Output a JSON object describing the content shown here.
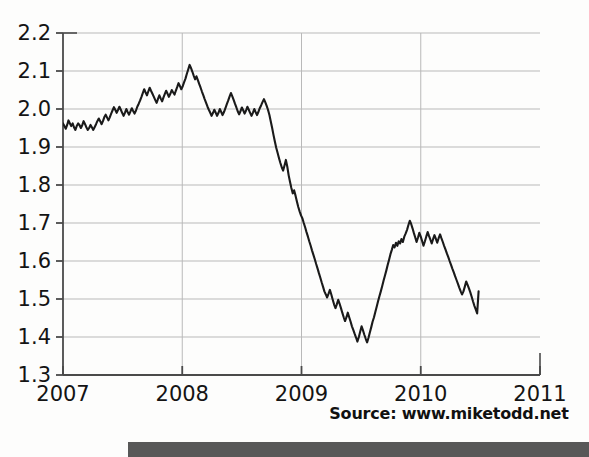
{
  "figure": {
    "source_note": "Source: www.miketodd.net"
  },
  "chart_data": {
    "type": "line",
    "title": "",
    "subtitle": "",
    "xlabel": "",
    "ylabel": "",
    "xlim": [
      2007.0,
      2011.0
    ],
    "ylim": [
      1.3,
      2.2
    ],
    "grid": true,
    "legend": null,
    "x_ticks": [
      "2007",
      "2008",
      "2009",
      "2010",
      "2011"
    ],
    "x_tick_values": [
      2007,
      2008,
      2009,
      2010,
      2011
    ],
    "y_ticks": [
      "1.3",
      "1.4",
      "1.5",
      "1.6",
      "1.7",
      "1.8",
      "1.9",
      "2.0",
      "2.1",
      "2.2"
    ],
    "y_tick_values": [
      1.3,
      1.4,
      1.5,
      1.6,
      1.7,
      1.8,
      1.9,
      2.0,
      2.1,
      2.2
    ],
    "line_color": "#1a1a1a",
    "grid_color": "#b9b9b9",
    "axis_color": "#4a4a4a",
    "series": [
      {
        "name": "Exchange rate",
        "x": [
          2007.0,
          2007.012,
          2007.023,
          2007.035,
          2007.046,
          2007.058,
          2007.069,
          2007.081,
          2007.092,
          2007.104,
          2007.115,
          2007.127,
          2007.138,
          2007.15,
          2007.162,
          2007.173,
          2007.185,
          2007.196,
          2007.208,
          2007.219,
          2007.231,
          2007.242,
          2007.254,
          2007.265,
          2007.277,
          2007.288,
          2007.3,
          2007.312,
          2007.323,
          2007.335,
          2007.346,
          2007.358,
          2007.369,
          2007.381,
          2007.392,
          2007.404,
          2007.415,
          2007.427,
          2007.438,
          2007.45,
          2007.462,
          2007.473,
          2007.485,
          2007.496,
          2007.508,
          2007.519,
          2007.531,
          2007.542,
          2007.554,
          2007.565,
          2007.577,
          2007.588,
          2007.6,
          2007.612,
          2007.623,
          2007.635,
          2007.646,
          2007.658,
          2007.669,
          2007.681,
          2007.692,
          2007.704,
          2007.715,
          2007.727,
          2007.738,
          2007.75,
          2007.762,
          2007.773,
          2007.785,
          2007.796,
          2007.808,
          2007.819,
          2007.831,
          2007.842,
          2007.854,
          2007.865,
          2007.877,
          2007.888,
          2007.9,
          2007.912,
          2007.923,
          2007.935,
          2007.946,
          2007.958,
          2007.969,
          2007.981,
          2007.992,
          2008.004,
          2008.015,
          2008.027,
          2008.038,
          2008.05,
          2008.062,
          2008.073,
          2008.085,
          2008.096,
          2008.108,
          2008.119,
          2008.131,
          2008.142,
          2008.154,
          2008.165,
          2008.177,
          2008.188,
          2008.2,
          2008.212,
          2008.223,
          2008.235,
          2008.246,
          2008.258,
          2008.269,
          2008.281,
          2008.292,
          2008.304,
          2008.315,
          2008.327,
          2008.338,
          2008.35,
          2008.362,
          2008.373,
          2008.385,
          2008.396,
          2008.408,
          2008.419,
          2008.431,
          2008.442,
          2008.454,
          2008.465,
          2008.477,
          2008.488,
          2008.5,
          2008.512,
          2008.523,
          2008.535,
          2008.546,
          2008.558,
          2008.569,
          2008.581,
          2008.592,
          2008.604,
          2008.615,
          2008.627,
          2008.638,
          2008.65,
          2008.662,
          2008.673,
          2008.685,
          2008.696,
          2008.708,
          2008.719,
          2008.731,
          2008.742,
          2008.754,
          2008.765,
          2008.777,
          2008.788,
          2008.8,
          2008.812,
          2008.823,
          2008.835,
          2008.846,
          2008.858,
          2008.869,
          2008.881,
          2008.892,
          2008.904,
          2008.915,
          2008.927,
          2008.938,
          2008.95,
          2008.962,
          2008.973,
          2008.985,
          2008.996,
          2009.008,
          2009.019,
          2009.031,
          2009.042,
          2009.054,
          2009.065,
          2009.077,
          2009.088,
          2009.1,
          2009.112,
          2009.123,
          2009.135,
          2009.146,
          2009.158,
          2009.169,
          2009.181,
          2009.192,
          2009.204,
          2009.215,
          2009.227,
          2009.238,
          2009.25,
          2009.262,
          2009.273,
          2009.285,
          2009.296,
          2009.308,
          2009.319,
          2009.331,
          2009.342,
          2009.354,
          2009.365,
          2009.377,
          2009.388,
          2009.4,
          2009.412,
          2009.423,
          2009.435,
          2009.446,
          2009.458,
          2009.469,
          2009.481,
          2009.492,
          2009.504,
          2009.515,
          2009.527,
          2009.538,
          2009.55,
          2009.562,
          2009.573,
          2009.585,
          2009.596,
          2009.608,
          2009.619,
          2009.631,
          2009.642,
          2009.654,
          2009.665,
          2009.677,
          2009.688,
          2009.7,
          2009.712,
          2009.723,
          2009.735,
          2009.746,
          2009.758,
          2009.769,
          2009.781,
          2009.792,
          2009.804,
          2009.815,
          2009.827,
          2009.838,
          2009.85,
          2009.862,
          2009.873,
          2009.885,
          2009.896,
          2009.908,
          2009.919,
          2009.931,
          2009.942,
          2009.954,
          2009.965,
          2009.977,
          2009.988,
          2010.0,
          2010.012,
          2010.023,
          2010.035,
          2010.046,
          2010.058,
          2010.069,
          2010.081,
          2010.092,
          2010.104,
          2010.115,
          2010.127,
          2010.138,
          2010.15,
          2010.162,
          2010.173,
          2010.185,
          2010.196,
          2010.208,
          2010.219,
          2010.231,
          2010.242,
          2010.254,
          2010.265,
          2010.277,
          2010.288,
          2010.3,
          2010.312,
          2010.323,
          2010.335,
          2010.346,
          2010.358,
          2010.369,
          2010.381,
          2010.392,
          2010.404,
          2010.415,
          2010.427,
          2010.438,
          2010.45,
          2010.462,
          2010.473,
          2010.485
        ],
        "y": [
          1.962,
          1.955,
          1.948,
          1.958,
          1.97,
          1.962,
          1.955,
          1.962,
          1.952,
          1.945,
          1.955,
          1.962,
          1.958,
          1.95,
          1.958,
          1.968,
          1.96,
          1.952,
          1.945,
          1.95,
          1.958,
          1.952,
          1.945,
          1.952,
          1.96,
          1.968,
          1.975,
          1.968,
          1.96,
          1.968,
          1.978,
          1.985,
          1.978,
          1.97,
          1.978,
          1.988,
          1.996,
          2.005,
          1.998,
          1.99,
          1.998,
          2.006,
          1.998,
          1.99,
          1.982,
          1.99,
          2.0,
          1.992,
          1.985,
          1.993,
          2.002,
          1.995,
          1.988,
          1.996,
          2.006,
          2.014,
          2.022,
          2.032,
          2.042,
          2.052,
          2.044,
          2.036,
          2.046,
          2.056,
          2.048,
          2.04,
          2.032,
          2.024,
          2.016,
          2.026,
          2.036,
          2.028,
          2.02,
          2.03,
          2.04,
          2.048,
          2.04,
          2.032,
          2.04,
          2.05,
          2.044,
          2.038,
          2.048,
          2.058,
          2.068,
          2.06,
          2.052,
          2.06,
          2.07,
          2.08,
          2.092,
          2.104,
          2.116,
          2.108,
          2.098,
          2.088,
          2.078,
          2.086,
          2.076,
          2.066,
          2.056,
          2.046,
          2.036,
          2.026,
          2.016,
          2.006,
          1.998,
          1.99,
          1.982,
          1.99,
          1.998,
          1.99,
          1.982,
          1.99,
          2.0,
          1.992,
          1.984,
          1.992,
          2.002,
          2.012,
          2.022,
          2.032,
          2.042,
          2.034,
          2.024,
          2.014,
          2.004,
          1.994,
          1.986,
          1.994,
          2.004,
          1.996,
          1.988,
          1.996,
          2.006,
          1.998,
          1.99,
          1.982,
          1.99,
          2.0,
          1.992,
          1.984,
          1.992,
          2.002,
          2.01,
          2.018,
          2.026,
          2.018,
          2.008,
          1.998,
          1.984,
          1.968,
          1.95,
          1.932,
          1.914,
          1.898,
          1.884,
          1.87,
          1.858,
          1.846,
          1.838,
          1.852,
          1.866,
          1.848,
          1.826,
          1.808,
          1.792,
          1.778,
          1.786,
          1.772,
          1.756,
          1.742,
          1.73,
          1.72,
          1.712,
          1.7,
          1.688,
          1.676,
          1.664,
          1.652,
          1.64,
          1.628,
          1.616,
          1.604,
          1.592,
          1.58,
          1.568,
          1.556,
          1.544,
          1.532,
          1.52,
          1.512,
          1.504,
          1.514,
          1.524,
          1.512,
          1.498,
          1.486,
          1.476,
          1.486,
          1.498,
          1.488,
          1.476,
          1.464,
          1.452,
          1.442,
          1.452,
          1.464,
          1.452,
          1.44,
          1.428,
          1.418,
          1.408,
          1.398,
          1.388,
          1.4,
          1.414,
          1.428,
          1.418,
          1.406,
          1.396,
          1.386,
          1.398,
          1.412,
          1.426,
          1.44,
          1.452,
          1.466,
          1.48,
          1.494,
          1.508,
          1.52,
          1.534,
          1.548,
          1.562,
          1.576,
          1.59,
          1.604,
          1.618,
          1.63,
          1.642,
          1.636,
          1.648,
          1.64,
          1.652,
          1.646,
          1.658,
          1.65,
          1.664,
          1.672,
          1.682,
          1.694,
          1.706,
          1.698,
          1.686,
          1.674,
          1.662,
          1.65,
          1.662,
          1.674,
          1.664,
          1.652,
          1.64,
          1.652,
          1.664,
          1.676,
          1.666,
          1.656,
          1.646,
          1.658,
          1.668,
          1.658,
          1.648,
          1.66,
          1.67,
          1.66,
          1.65,
          1.64,
          1.63,
          1.62,
          1.61,
          1.6,
          1.59,
          1.58,
          1.57,
          1.56,
          1.55,
          1.54,
          1.53,
          1.52,
          1.512,
          1.52,
          1.532,
          1.546,
          1.538,
          1.528,
          1.518,
          1.506,
          1.494,
          1.482,
          1.472,
          1.462,
          1.52
        ]
      }
    ]
  }
}
